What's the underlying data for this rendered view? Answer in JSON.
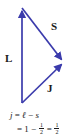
{
  "figure": {
    "background_color": "#ffffff",
    "vector_color": "#3b3bac",
    "text_color": "#1a1a1a"
  },
  "diagram": {
    "type": "vector-triangle",
    "vectors": [
      {
        "name": "L",
        "label": "L",
        "from": [
          22,
          103
        ],
        "to": [
          22,
          8
        ],
        "arrowhead": "end",
        "direction": "up"
      },
      {
        "name": "S",
        "label": "S",
        "from": [
          22,
          8
        ],
        "to": [
          64,
          62
        ],
        "arrowhead": "end",
        "direction": "down-right"
      },
      {
        "name": "J",
        "label": "J",
        "from": [
          22,
          103
        ],
        "to": [
          64,
          62
        ],
        "arrowhead": "end",
        "direction": "up-right"
      }
    ],
    "labels": {
      "L": "L",
      "S": "S",
      "J": "J"
    }
  },
  "equations": {
    "line1": {
      "lhs": "j",
      "eq": "=",
      "term1": "ℓ",
      "op": "−",
      "term2": "s"
    },
    "line2": {
      "eq": "=",
      "term1": "1",
      "op": "−",
      "fraction1": {
        "numerator": "1",
        "denominator": "2"
      },
      "eq2": "=",
      "fraction2": {
        "numerator": "1",
        "denominator": "2"
      }
    }
  }
}
